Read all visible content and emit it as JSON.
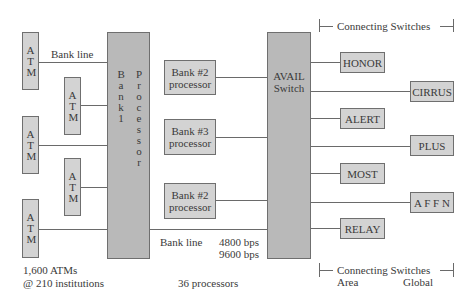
{
  "diagram": {
    "atms": [
      {
        "label": "ATM"
      },
      {
        "label": "ATM"
      },
      {
        "label": "ATM"
      },
      {
        "label": "ATM"
      },
      {
        "label": "ATM"
      }
    ],
    "bank_line_top": "Bank line",
    "bank1_processor": {
      "col1": "Bank 1",
      "col2": "Processor"
    },
    "bank_processors": [
      {
        "line1": "Bank #2",
        "line2": "processor"
      },
      {
        "line1": "Bank #3",
        "line2": "processor"
      },
      {
        "line1": "Bank #2",
        "line2": "processor"
      }
    ],
    "avail_switch": {
      "line1": "AVAIL",
      "line2": "Switch"
    },
    "area_switches": [
      "HONOR",
      "ALERT",
      "MOST",
      "RELAY"
    ],
    "global_switches": [
      "CIRRUS",
      "PLUS",
      "A F F N"
    ],
    "bank_line_bottom": "Bank line",
    "speeds": [
      "4800 bps",
      "9600 bps"
    ],
    "header": "Connecting Switches",
    "footer": {
      "title": "Connecting Switches",
      "area": "Area",
      "global": "Global"
    },
    "atm_caption": [
      "1,600 ATMs",
      "@ 210 institutions"
    ],
    "processors_caption": "36 processors"
  }
}
